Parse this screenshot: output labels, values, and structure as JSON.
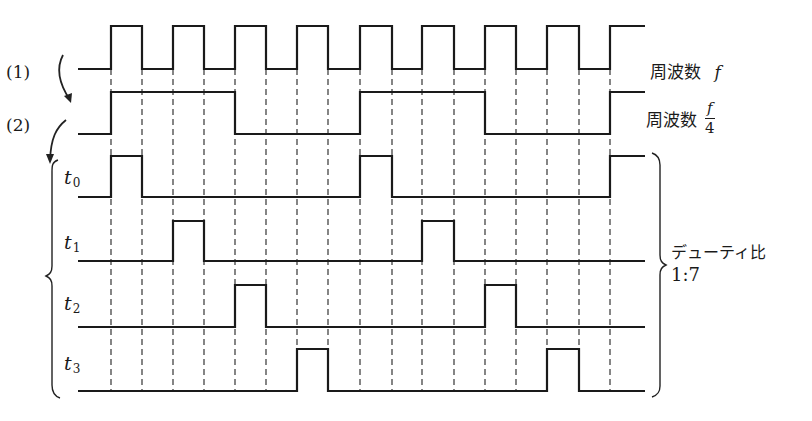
{
  "diagram": {
    "type": "timing-diagram",
    "steps": [
      "(1)",
      "(2)"
    ],
    "signals": [
      {
        "id": "clock",
        "label": "周波数",
        "label_var": "f",
        "high_y": 26,
        "low_y": 69,
        "edges_x": [
          111,
          142,
          173,
          204,
          235,
          266,
          297,
          328,
          360,
          392,
          422,
          454,
          485,
          516,
          547,
          579,
          610
        ],
        "start_level": "low",
        "start_x": 78,
        "end_x": 645
      },
      {
        "id": "div4",
        "label": "周波数",
        "frac_num": "f",
        "frac_den": "4",
        "high_y": 92,
        "low_y": 134,
        "edges_x": [
          111,
          235,
          360,
          485,
          610
        ],
        "start_level": "low",
        "start_x": 78,
        "end_x": 645
      },
      {
        "id": "t0",
        "label": "t",
        "sub": "0",
        "high_y": 156,
        "low_y": 197,
        "edges_x": [
          111,
          142,
          360,
          392,
          610
        ],
        "start_level": "low",
        "start_x": 78,
        "end_x": 645
      },
      {
        "id": "t1",
        "label": "t",
        "sub": "1",
        "high_y": 221,
        "low_y": 261,
        "edges_x": [
          173,
          204,
          422,
          454
        ],
        "start_level": "low",
        "start_x": 78,
        "end_x": 645
      },
      {
        "id": "t2",
        "label": "t",
        "sub": "2",
        "high_y": 285,
        "low_y": 327,
        "edges_x": [
          235,
          266,
          485,
          516
        ],
        "start_level": "low",
        "start_x": 78,
        "end_x": 645
      },
      {
        "id": "t3",
        "label": "t",
        "sub": "3",
        "high_y": 349,
        "low_y": 391,
        "edges_x": [
          297,
          328,
          547,
          579
        ],
        "start_level": "low",
        "start_x": 78,
        "end_x": 645
      }
    ],
    "dashed_guides_x": [
      111,
      142,
      173,
      204,
      235,
      266,
      297,
      328,
      360,
      392,
      422,
      454,
      485,
      516,
      547,
      579,
      610
    ],
    "dashed_guides_y": [
      69,
      391
    ],
    "duty": {
      "label": "デューティ比",
      "ratio": "1:7"
    }
  },
  "labels": {
    "step1": "(1)",
    "step2": "(2)",
    "freq_f": "周波数",
    "f": "f",
    "freq_f4": "周波数",
    "frac_num": "f",
    "frac_den": "4",
    "t": "t",
    "t0_sub": "0",
    "t1_sub": "1",
    "t2_sub": "2",
    "t3_sub": "3",
    "duty_label": "デューティ比",
    "duty_ratio": "1:7"
  }
}
